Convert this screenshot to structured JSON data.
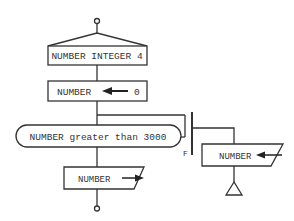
{
  "diagram": {
    "type": "flowchart",
    "colors": {
      "stroke": "#333333",
      "background": "#ffffff"
    },
    "nodes": {
      "start": {
        "shape": "terminal-circle"
      },
      "declare": {
        "shape": "declaration-box",
        "label": "NUMBER INTEGER 4"
      },
      "assign": {
        "shape": "process-box",
        "target": "NUMBER",
        "value": "0",
        "arrow": "left-arrow"
      },
      "loop": {
        "shape": "loop-condition",
        "label": "NUMBER greater than 3000",
        "exit_label": "F"
      },
      "input": {
        "shape": "io-parallelogram",
        "label": "NUMBER",
        "direction": "input"
      },
      "output": {
        "shape": "io-parallelogram",
        "label": "NUMBER",
        "direction": "output"
      },
      "loop_end": {
        "shape": "triangle-connector"
      },
      "end": {
        "shape": "terminal-circle"
      }
    }
  }
}
